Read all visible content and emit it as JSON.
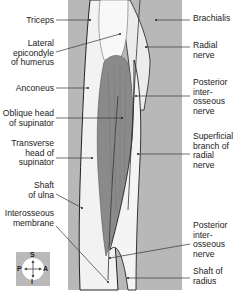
{
  "figure": {
    "colors": {
      "background_panel": "#b8b8b8",
      "muscle": "#8a8a8a",
      "bone": "#f3f3f3",
      "outline": "#222222",
      "leader": "#333333"
    },
    "labels_left": [
      {
        "id": "triceps",
        "text": "Triceps",
        "x": 4,
        "y": 16,
        "w": 50
      },
      {
        "id": "lateral-epicondyle",
        "text": "Lateral\nepicondyle\nof humerus",
        "x": 4,
        "y": 39,
        "w": 50
      },
      {
        "id": "anconeus",
        "text": "Anconeus",
        "x": 4,
        "y": 84,
        "w": 50
      },
      {
        "id": "oblique-head-supinator",
        "text": "Oblique head\nof supinator",
        "x": 0,
        "y": 109,
        "w": 54
      },
      {
        "id": "transverse-head-supinator",
        "text": "Transverse\nhead of\nsupinator",
        "x": 4,
        "y": 139,
        "w": 50
      },
      {
        "id": "shaft-ulna",
        "text": "Shaft\nof ulna",
        "x": 4,
        "y": 181,
        "w": 50
      },
      {
        "id": "interosseous-membrane",
        "text": "Interosseous\nmembrane",
        "x": 0,
        "y": 209,
        "w": 54
      }
    ],
    "labels_right": [
      {
        "id": "brachialis",
        "text": "Brachialis",
        "x": 193,
        "y": 14
      },
      {
        "id": "radial-nerve",
        "text": "Radial\nnerve",
        "x": 193,
        "y": 41
      },
      {
        "id": "posterior-interosseous-nerve-top",
        "text": "Posterior\ninter-\nosseous\nnerve",
        "x": 193,
        "y": 78
      },
      {
        "id": "superficial-branch-radial",
        "text": "Superficial\nbranch of\nradial\nnerve",
        "x": 193,
        "y": 132
      },
      {
        "id": "posterior-interosseous-nerve-bottom",
        "text": "Posterior\ninter-\nosseous\nnerve",
        "x": 193,
        "y": 221
      },
      {
        "id": "shaft-radius",
        "text": "Shaft of\nradius",
        "x": 193,
        "y": 267
      }
    ],
    "compass": {
      "top": "S",
      "bottom": "I",
      "left": "P",
      "right": "A"
    }
  }
}
